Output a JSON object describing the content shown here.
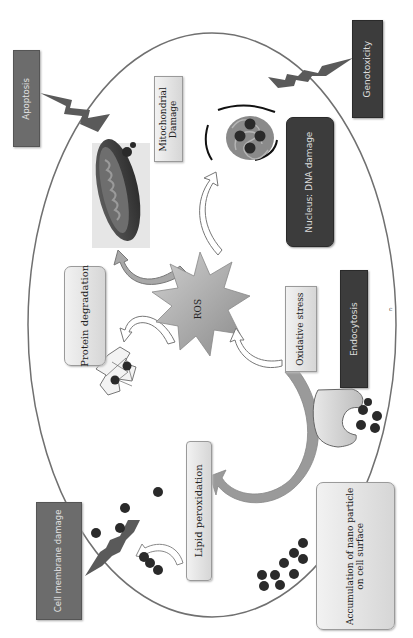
{
  "diagram": {
    "orientation": "rotated 90 degrees counter-clockwise",
    "center_node": {
      "label": "ROS",
      "shape": "starburst"
    },
    "inside_cell_labels": {
      "mitochondrial_damage": "Mitochondrial\nDamage",
      "mitochondrial_damage_line1": "Mitochondrial",
      "mitochondrial_damage_line2": "Damage",
      "nucleus_dna_damage": "Nucleus: DNA damage",
      "protein_degradation": "Protein degradation",
      "oxidative_stress": "Oxidative stress",
      "lipid_peroxidation": "Lipid peroxidation",
      "endocytosis": "Endocytosis"
    },
    "outside_cell_labels": {
      "apoptosis": "Apoptosis",
      "genotoxicity": "Genotoxicity",
      "cell_membrane_damage": "Cell membrane damage",
      "accumulation_line1": "Accumulation of nano particle",
      "accumulation_line2": "on cell surface"
    },
    "stray_mark": "c",
    "edges": [
      {
        "from": "ROS",
        "to": "Mitochondrial Damage",
        "style": "curved-arrow"
      },
      {
        "from": "ROS",
        "to": "Nucleus: DNA damage",
        "style": "curved-arrow"
      },
      {
        "from": "ROS",
        "to": "Protein degradation",
        "style": "curved-arrow"
      },
      {
        "from": "Oxidative stress",
        "to": "ROS",
        "style": "curved-arrow"
      },
      {
        "from": "Oxidative stress",
        "to": "Lipid peroxidation",
        "style": "curved-arrow"
      },
      {
        "from": "Mitochondrial Damage",
        "to": "Apoptosis",
        "style": "lightning"
      },
      {
        "from": "Nucleus: DNA damage",
        "to": "Genotoxicity",
        "style": "lightning"
      },
      {
        "from": "Lipid peroxidation",
        "to": "Cell membrane damage",
        "style": "lightning"
      }
    ],
    "colors": {
      "cell_outline": "#707070",
      "dark_box": "#3c3c3c",
      "mid_box": "#6c6c6c",
      "light_box": "#e4e4e4",
      "nanoparticle": "#2a2a2a",
      "arrow_gray": "#8c8c8c",
      "lightning": "#5a5a5a"
    }
  }
}
